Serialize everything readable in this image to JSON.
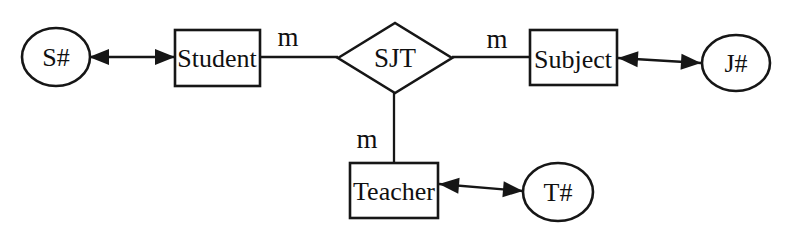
{
  "diagram": {
    "colors": {
      "ink": "#161616",
      "background": "#ffffff"
    },
    "relationship": {
      "label": "SJT"
    },
    "entities": {
      "student": {
        "label": "Student"
      },
      "subject": {
        "label": "Subject"
      },
      "teacher": {
        "label": "Teacher"
      }
    },
    "attributes": {
      "student_key": {
        "label": "S#"
      },
      "subject_key": {
        "label": "J#"
      },
      "teacher_key": {
        "label": "T#"
      }
    },
    "cardinalities": {
      "student_sjt": {
        "label": "m"
      },
      "sjt_subject": {
        "label": "m"
      },
      "sjt_teacher": {
        "label": "m"
      }
    }
  }
}
